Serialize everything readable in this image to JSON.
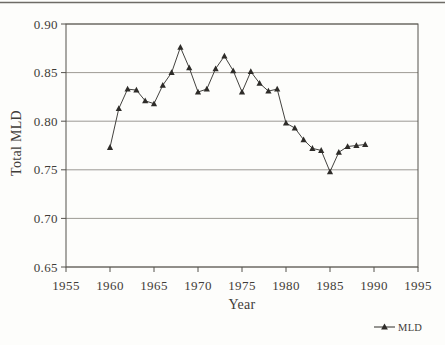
{
  "chart_data": {
    "type": "line",
    "title": "",
    "xlabel": "Year",
    "ylabel": "Total MLD",
    "xlim": [
      1955,
      1995
    ],
    "ylim": [
      0.65,
      0.9
    ],
    "xticks": [
      1955,
      1960,
      1965,
      1970,
      1975,
      1980,
      1985,
      1990,
      1995
    ],
    "yticks": [
      0.65,
      0.7,
      0.75,
      0.8,
      0.85,
      0.9
    ],
    "grid": "horizontal-only",
    "legend": {
      "position": "bottom-right",
      "entries": [
        {
          "label": "MLD",
          "marker": "filled-triangle-on-line"
        }
      ]
    },
    "x": [
      1960,
      1961,
      1962,
      1963,
      1964,
      1965,
      1966,
      1967,
      1968,
      1969,
      1970,
      1971,
      1972,
      1973,
      1974,
      1975,
      1976,
      1977,
      1978,
      1979,
      1980,
      1981,
      1982,
      1983,
      1984,
      1985,
      1986,
      1987,
      1988,
      1989
    ],
    "series": [
      {
        "name": "MLD",
        "marker": "triangle",
        "values": [
          0.773,
          0.813,
          0.833,
          0.832,
          0.821,
          0.818,
          0.837,
          0.85,
          0.876,
          0.855,
          0.83,
          0.833,
          0.854,
          0.867,
          0.852,
          0.83,
          0.851,
          0.839,
          0.831,
          0.833,
          0.798,
          0.793,
          0.781,
          0.772,
          0.77,
          0.748,
          0.768,
          0.774,
          0.775,
          0.776
        ]
      }
    ],
    "colors": {
      "background": "#fdfdfb",
      "line": "#2e2c29",
      "text": "#3f3c38",
      "grid": "#84807a",
      "frame": "#55524d",
      "rule": "#6e6b66"
    }
  }
}
